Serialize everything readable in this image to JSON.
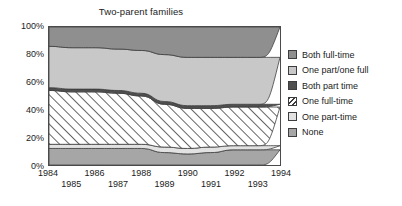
{
  "chart_data": {
    "type": "area",
    "title": "Two-parent families",
    "xlabel": "",
    "ylabel": "",
    "ylim": [
      0,
      100
    ],
    "grid": false,
    "stacked": true,
    "stack_order_bottom_to_top": [
      "None",
      "One part-time",
      "One full-time",
      "Both part time",
      "One part/one full",
      "Both full-time"
    ],
    "legend_position": "right",
    "x": [
      1984,
      1985,
      1986,
      1987,
      1988,
      1989,
      1990,
      1991,
      1992,
      1993,
      1994
    ],
    "x_tick_labels": [
      "1984",
      "1985",
      "1986",
      "1987",
      "1988",
      "1989",
      "1990",
      "1991",
      "1992",
      "1993",
      "1994"
    ],
    "y_tick_labels": [
      "0%",
      "20%",
      "40%",
      "60%",
      "80%",
      "100%"
    ],
    "y_ticks": [
      0,
      20,
      40,
      60,
      80,
      100
    ],
    "series": [
      {
        "name": "None",
        "color": "#a6a6a6",
        "pattern": "solid",
        "values": [
          12,
          12,
          12,
          12,
          12,
          9,
          8,
          9,
          11,
          11,
          11
        ]
      },
      {
        "name": "One part-time",
        "color": "#e2e2e2",
        "pattern": "solid",
        "values": [
          3,
          3,
          3,
          3,
          3,
          4,
          4,
          4,
          3,
          3,
          3
        ]
      },
      {
        "name": "One full-time",
        "color": "#ffffff",
        "pattern": "diagonal-hatch",
        "values": [
          39,
          38,
          38,
          37,
          35,
          31,
          29,
          28,
          28,
          28,
          28
        ]
      },
      {
        "name": "Both part time",
        "color": "#4f4f4f",
        "pattern": "solid",
        "values": [
          2,
          2,
          2,
          2,
          2,
          2,
          2,
          2,
          2,
          2,
          2
        ]
      },
      {
        "name": "One part/one full",
        "color": "#c8c8c8",
        "pattern": "solid",
        "values": [
          30,
          30,
          30,
          30,
          31,
          34,
          35,
          35,
          34,
          34,
          34
        ]
      },
      {
        "name": "Both full-time",
        "color": "#8f8f8f",
        "pattern": "solid",
        "values": [
          14,
          15,
          15,
          16,
          17,
          20,
          22,
          22,
          22,
          22,
          22
        ]
      }
    ]
  },
  "legend": {
    "items": [
      {
        "label": "Both full-time",
        "color": "#8f8f8f",
        "pattern": "solid"
      },
      {
        "label": "One part/one full",
        "color": "#c8c8c8",
        "pattern": "solid"
      },
      {
        "label": "Both part time",
        "color": "#4f4f4f",
        "pattern": "solid"
      },
      {
        "label": "One full-time",
        "color": "#ffffff",
        "pattern": "diagonal-hatch"
      },
      {
        "label": "One part-time",
        "color": "#e2e2e2",
        "pattern": "solid"
      },
      {
        "label": "None",
        "color": "#a6a6a6",
        "pattern": "solid"
      }
    ]
  }
}
